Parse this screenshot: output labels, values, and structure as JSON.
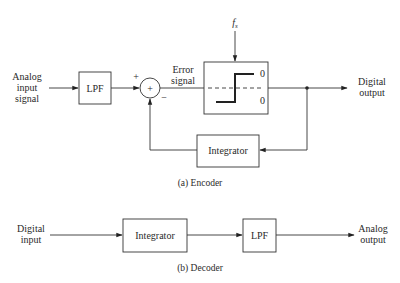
{
  "encoder": {
    "input_label": [
      "Analog",
      "input",
      "signal"
    ],
    "lpf_label": "LPF",
    "summer_symbol": "+",
    "plus_sign": "+",
    "minus_sign": "−",
    "error_label": [
      "Error",
      "signal"
    ],
    "clock_label": "f",
    "clock_subscript": "s",
    "quantizer_high": "0",
    "quantizer_low": "0",
    "output_label": [
      "Digital",
      "output"
    ],
    "integrator_label": "Integrator",
    "caption": "(a)  Encoder"
  },
  "decoder": {
    "input_label": [
      "Digital",
      "input"
    ],
    "integrator_label": "Integrator",
    "lpf_label": "LPF",
    "output_label": [
      "Analog",
      "output"
    ],
    "caption": "(b)  Decoder"
  }
}
